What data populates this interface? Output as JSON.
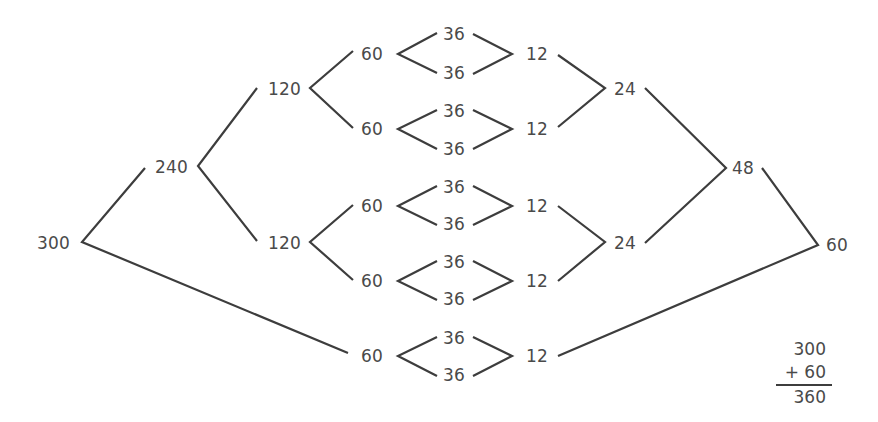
{
  "diagram": {
    "type": "factor-tree",
    "nodes": {
      "root_300": "300",
      "n_240": "240",
      "n_120_top": "120",
      "n_120_bottom": "120",
      "r1_60": "60",
      "r1_36a": "36",
      "r1_36b": "36",
      "r1_12": "12",
      "r2_60": "60",
      "r2_36a": "36",
      "r2_36b": "36",
      "r2_12": "12",
      "r3_60": "60",
      "r3_36a": "36",
      "r3_36b": "36",
      "r3_12": "12",
      "r4_60": "60",
      "r4_36a": "36",
      "r4_36b": "36",
      "r4_12": "12",
      "r5_60": "60",
      "r5_36a": "36",
      "r5_36b": "36",
      "r5_12": "12",
      "n_24_top": "24",
      "n_24_bottom": "24",
      "n_48": "48",
      "result_60": "60"
    },
    "sum": {
      "addend1": "300",
      "addend2": "+ 60",
      "total": "360"
    },
    "colors": {
      "line": "#3d3d3d",
      "text": "#4a4a4a",
      "background": "#ffffff"
    }
  }
}
